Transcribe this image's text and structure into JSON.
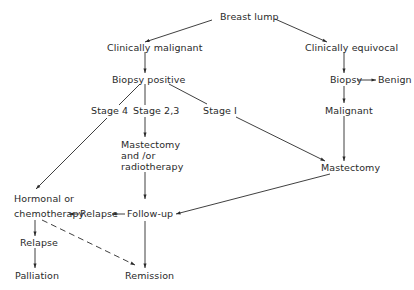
{
  "diagram": {
    "type": "flowchart",
    "nodes": {
      "breast_lump": "Breast lump",
      "clin_malignant": "Clinically malignant",
      "clin_equivocal": "Clinically equivocal",
      "biopsy_positive": "Biopsy positive",
      "biopsy": "Biopsy",
      "benign": "Benign",
      "malignant": "Malignant",
      "stage4": "Stage 4",
      "stage23": "Stage 2,3",
      "stage1": "Stage I",
      "mast_radio_1": "Mastectomy",
      "mast_radio_2": "and /or",
      "mast_radio_3": "radiotherapy",
      "mastectomy": "Mastectomy",
      "hormonal_1": "Hormonal or",
      "hormonal_2": "chemotherapy",
      "relapse_mid": "Relapse",
      "followup": "Follow-up",
      "relapse_low": "Relapse",
      "palliation": "Palliation",
      "remission": "Remission"
    },
    "edges": [
      {
        "from": "Breast lump",
        "to": "Clinically malignant",
        "style": "solid"
      },
      {
        "from": "Breast lump",
        "to": "Clinically equivocal",
        "style": "solid"
      },
      {
        "from": "Clinically malignant",
        "to": "Biopsy positive",
        "style": "solid"
      },
      {
        "from": "Biopsy positive",
        "to": "Stage 4",
        "style": "solid"
      },
      {
        "from": "Biopsy positive",
        "to": "Stage 2,3",
        "style": "solid"
      },
      {
        "from": "Biopsy positive",
        "to": "Stage I",
        "style": "solid"
      },
      {
        "from": "Stage 4",
        "to": "Hormonal or chemotherapy",
        "style": "solid"
      },
      {
        "from": "Stage 2,3",
        "to": "Mastectomy and/or radiotherapy",
        "style": "solid"
      },
      {
        "from": "Stage I",
        "to": "Mastectomy",
        "style": "solid"
      },
      {
        "from": "Clinically equivocal",
        "to": "Biopsy",
        "style": "solid"
      },
      {
        "from": "Biopsy",
        "to": "Benign",
        "style": "solid"
      },
      {
        "from": "Biopsy",
        "to": "Malignant",
        "style": "solid"
      },
      {
        "from": "Malignant",
        "to": "Mastectomy",
        "style": "solid"
      },
      {
        "from": "Mastectomy and/or radiotherapy",
        "to": "Follow-up",
        "style": "solid"
      },
      {
        "from": "Mastectomy",
        "to": "Follow-up",
        "style": "solid"
      },
      {
        "from": "Follow-up",
        "to": "Relapse",
        "style": "solid"
      },
      {
        "from": "Relapse",
        "to": "Hormonal or chemotherapy",
        "style": "solid"
      },
      {
        "from": "Follow-up",
        "to": "Remission",
        "style": "solid"
      },
      {
        "from": "Hormonal or chemotherapy",
        "to": "Relapse (lower)",
        "style": "solid"
      },
      {
        "from": "Relapse (lower)",
        "to": "Palliation",
        "style": "solid"
      },
      {
        "from": "Hormonal or chemotherapy",
        "to": "Remission",
        "style": "dashed"
      }
    ],
    "colors": {
      "line": "#2a2a2a",
      "text": "#2a2a2a",
      "background": "#ffffff"
    }
  }
}
